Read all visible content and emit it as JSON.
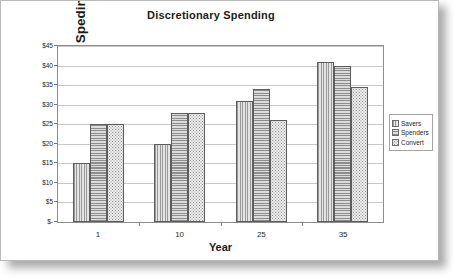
{
  "chart_data": {
    "type": "bar",
    "title": "Discretionary Spending",
    "xlabel": "Year",
    "ylabel": "Discretionary Speding (000)",
    "categories": [
      "1",
      "10",
      "25",
      "35"
    ],
    "series": [
      {
        "name": "Savers",
        "values": [
          15,
          20,
          31,
          41
        ],
        "pattern": "vertical-lines"
      },
      {
        "name": "Spenders",
        "values": [
          25,
          28,
          34,
          40
        ],
        "pattern": "horizontal-lines"
      },
      {
        "name": "Convert",
        "values": [
          25,
          28,
          26,
          34.5
        ],
        "pattern": "dotted"
      }
    ],
    "ylim": [
      0,
      45
    ],
    "ytick_labels": [
      "$45",
      "$40",
      "$35",
      "$30",
      "$25",
      "$20",
      "$15",
      "$10",
      "$5",
      "$-"
    ],
    "ytick_values": [
      45,
      40,
      35,
      30,
      25,
      20,
      15,
      10,
      5,
      0
    ],
    "grid": true,
    "legend_position": "right",
    "legend_entries": [
      "Savers",
      "Spenders",
      "Convert"
    ]
  },
  "colors": {
    "page_background": "#ffffff",
    "frame_border": "#8d8d8d",
    "gridline": "#c9c9c9",
    "text": "#1a1a1a",
    "bar_outline": "#5d5d5d"
  }
}
